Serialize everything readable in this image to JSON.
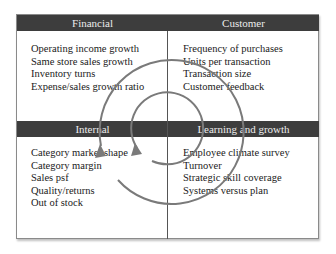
{
  "diagram": {
    "quadrants": [
      {
        "id": "financial",
        "title": "Financial",
        "items": [
          "Operating income growth",
          "Same store sales growth",
          "Inventory turns",
          "Expense/sales growth ratio"
        ]
      },
      {
        "id": "customer",
        "title": "Customer",
        "items": [
          "Frequency of purchases",
          "Units per transaction",
          "Transaction size",
          "Customer feedback"
        ]
      },
      {
        "id": "internal",
        "title": "Internal",
        "items": [
          "Category market shape",
          "Category margin",
          "Sales psf",
          "Quality/returns",
          "Out of stock"
        ]
      },
      {
        "id": "learning",
        "title": "Learning and growth",
        "items": [
          "Employee climate survey",
          "Turnover",
          "Strategic skill coverage",
          "Systems versus plan"
        ]
      }
    ],
    "cycle_arrows": [
      {
        "name": "outer-cycle",
        "shape": "circle-arrow",
        "direction": "clockwise"
      },
      {
        "name": "inner-cycle",
        "shape": "circle-arrow",
        "direction": "clockwise"
      }
    ],
    "colors": {
      "header_bg": "#3d3d3d",
      "header_text": "#ececec",
      "cycle_stroke": "#7a7a7a",
      "body_text": "#1a1a1a",
      "border": "#8a8a8a"
    }
  }
}
